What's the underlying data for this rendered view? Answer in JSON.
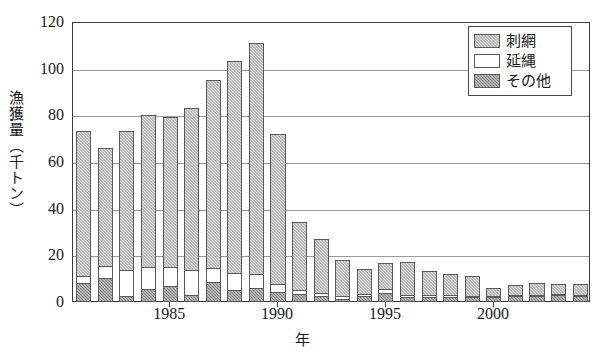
{
  "chart_data": {
    "type": "bar",
    "stacked": true,
    "title": "",
    "xlabel": "年",
    "ylabel": "漁獲量（千トン）",
    "ylim": [
      0,
      120
    ],
    "yticks": [
      0,
      20,
      40,
      60,
      80,
      100,
      120
    ],
    "xticks": [
      "1985",
      "1990",
      "1995",
      "2000"
    ],
    "xtick_years": [
      1985,
      1990,
      1995,
      2000
    ],
    "grid": true,
    "legend_position": "top-right",
    "categories": [
      1981,
      1982,
      1983,
      1984,
      1985,
      1986,
      1987,
      1988,
      1989,
      1990,
      1991,
      1992,
      1993,
      1994,
      1995,
      1996,
      1997,
      1998,
      1999,
      2000,
      2001,
      2002,
      2003,
      2004
    ],
    "series": [
      {
        "name": "その他",
        "color": "#8d8d8d",
        "values": [
          8.0,
          10.5,
          2.5,
          5.5,
          7.0,
          3.0,
          8.5,
          5.0,
          6.0,
          4.5,
          3.5,
          2.5,
          1.5,
          2.5,
          4.0,
          2.0,
          2.0,
          2.0,
          2.0,
          2.0,
          2.5,
          2.5,
          3.0,
          2.5
        ]
      },
      {
        "name": "延縄",
        "color": "#ffffff",
        "values": [
          3.5,
          5.5,
          11.5,
          10.0,
          8.5,
          11.0,
          6.5,
          8.0,
          6.5,
          3.5,
          2.0,
          2.0,
          1.5,
          1.5,
          2.0,
          1.5,
          1.5,
          1.5,
          1.0,
          0.5,
          0.5,
          1.0,
          1.0,
          1.0
        ]
      },
      {
        "name": "刺網",
        "color": "#d9d9d9",
        "values": [
          62.5,
          51.0,
          60.0,
          65.5,
          64.5,
          70.0,
          81.0,
          91.0,
          99.5,
          65.0,
          29.5,
          23.5,
          16.0,
          11.0,
          11.5,
          14.5,
          10.5,
          9.5,
          9.0,
          4.0,
          5.0,
          5.5,
          4.5,
          5.0
        ]
      }
    ],
    "totals": [
      74,
      67,
      74,
      81,
      80,
      84,
      96,
      104,
      112,
      73,
      35,
      28,
      19,
      15,
      17.5,
      18,
      14,
      13,
      12,
      6.5,
      8,
      9,
      8.5,
      8.5
    ]
  },
  "legend": {
    "items": [
      {
        "label": "刺網",
        "swatch": "gillnet"
      },
      {
        "label": "延縄",
        "swatch": "longline"
      },
      {
        "label": "その他",
        "swatch": "other"
      }
    ]
  }
}
